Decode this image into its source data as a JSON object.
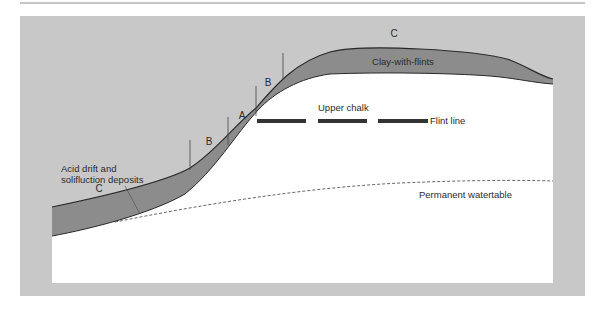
{
  "diagram": {
    "type": "geological cross-section",
    "colors": {
      "panel_gray": "#c8c8c8",
      "deposit_dark": "#8c8c8c",
      "chalk_white": "#ffffff",
      "line": "#2a2a2a",
      "top_rule": "#8a8a8a",
      "flint": "#333333"
    },
    "labels": {
      "zone_c_top": "C",
      "clay_with_flints": "Clay-with-flints",
      "zone_b_upper": "B",
      "zone_a": "A",
      "zone_b_lower": "B",
      "upper_chalk": "Upper chalk",
      "flint_line": "Flint line",
      "acid_drift_line1": "Acid drift and",
      "acid_drift_line2": "solifluction deposits",
      "zone_c_bottom": "C",
      "watertable": "Permanent watertable"
    }
  }
}
